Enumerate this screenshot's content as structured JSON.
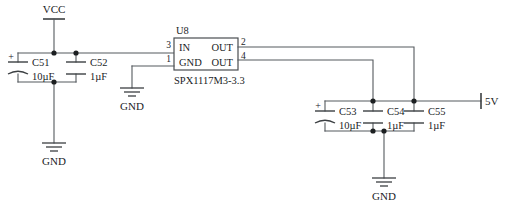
{
  "diagram": {
    "type": "circuit-schematic"
  },
  "nets": {
    "vcc": "VCC",
    "gnd_input": "GND",
    "gnd_regulator": "GND",
    "gnd_output": "GND",
    "output": "5V"
  },
  "ic": {
    "designator": "U8",
    "part_number": "SPX1117M3-3.3",
    "pins": {
      "in": {
        "name": "IN",
        "number": "3"
      },
      "gnd": {
        "name": "GND",
        "number": "1"
      },
      "out_top": {
        "name": "OUT",
        "number": "2"
      },
      "out_bottom": {
        "name": "OUT",
        "number": "4"
      }
    }
  },
  "capacitors": [
    {
      "designator": "C51",
      "value": "10µF",
      "polarity": "+",
      "polarized": true
    },
    {
      "designator": "C52",
      "value": "1µF",
      "polarity": "",
      "polarized": false
    },
    {
      "designator": "C53",
      "value": "10µF",
      "polarity": "+",
      "polarized": true
    },
    {
      "designator": "C54",
      "value": "1µF",
      "polarity": "",
      "polarized": false
    },
    {
      "designator": "C55",
      "value": "1µF",
      "polarity": "",
      "polarized": false
    }
  ],
  "colors": {
    "wire": "#555a5e",
    "symbol": "#3b3f42",
    "text": "#1a1d1f",
    "background": "#ffffff"
  }
}
